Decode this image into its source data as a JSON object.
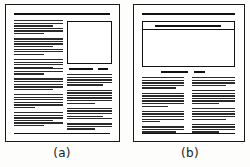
{
  "figure": {
    "type": "page-layout-diagram",
    "ink_color": "#111111",
    "paper_color": "#ffffff",
    "panels": [
      {
        "id": "a",
        "caption": "(a)",
        "description": "Portrait page with top rule, tall left text column, square image box upper-right, two-part caption rule, lower-right text column and bottom rule",
        "elements": {
          "top_rule": "thick horizontal rule across the text measure",
          "image_box": "square image placeholder, upper right",
          "caption_rule_segments": 2,
          "columns": 2,
          "bottom_rule": "thin horizontal rule near page foot"
        }
      },
      {
        "id": "b",
        "caption": "(b)",
        "description": "Portrait page with top rule, wide landscape image box spanning full measure with headline rule inside, two-part caption rule, two text columns below and bottom rule",
        "elements": {
          "top_rule": "thick horizontal rule across the text measure",
          "image_box": "wide landscape image placeholder spanning the measure",
          "headline_inside_box": true,
          "caption_rule_segments": 2,
          "columns": 2,
          "bottom_rule": "thin horizontal rule near page foot"
        }
      }
    ]
  }
}
